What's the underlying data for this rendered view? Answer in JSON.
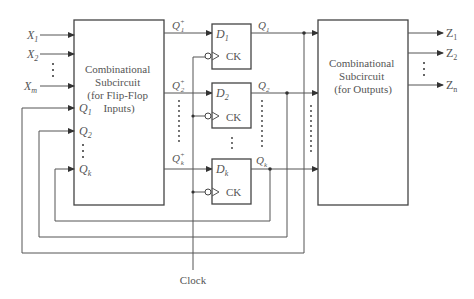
{
  "diagram": {
    "left_block": {
      "label_lines": [
        "Combinational",
        "Subcircuit",
        "(for Flip-Flop",
        "Inputs)"
      ],
      "inputs": [
        {
          "base": "X",
          "sub": "1"
        },
        {
          "base": "X",
          "sub": "2"
        },
        {
          "base": "X",
          "sub": "m"
        }
      ],
      "feedback_inputs": [
        {
          "base": "Q",
          "sub": "1"
        },
        {
          "base": "Q",
          "sub": "2"
        },
        {
          "base": "Q",
          "sub": "k"
        }
      ],
      "outputs": [
        {
          "base": "Q",
          "sub": "1",
          "sup": "+"
        },
        {
          "base": "Q",
          "sub": "2",
          "sup": "+"
        },
        {
          "base": "Q",
          "sub": "k",
          "sup": "+"
        }
      ]
    },
    "flip_flops": [
      {
        "d_base": "D",
        "d_sub": "1",
        "ck": "CK",
        "q_base": "Q",
        "q_sub": "1"
      },
      {
        "d_base": "D",
        "d_sub": "2",
        "ck": "CK",
        "q_base": "Q",
        "q_sub": "2"
      },
      {
        "d_base": "D",
        "d_sub": "k",
        "ck": "CK",
        "q_base": "Q",
        "q_sub": "k"
      }
    ],
    "right_block": {
      "label_lines": [
        "Combinational",
        "Subcircuit",
        "(for Outputs)"
      ],
      "outputs": [
        {
          "base": "Z",
          "sub": "1"
        },
        {
          "base": "Z",
          "sub": "2"
        },
        {
          "base": "Z",
          "sub": "n"
        }
      ]
    },
    "clock_label": "Clock",
    "ellipsis": "⋮"
  }
}
